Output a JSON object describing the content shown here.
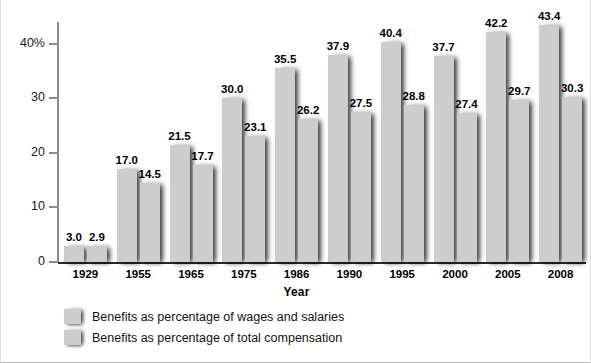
{
  "chart_data": {
    "type": "bar",
    "title": "",
    "xlabel": "Year",
    "ylabel": "Percentage",
    "categories": [
      "1929",
      "1955",
      "1965",
      "1975",
      "1986",
      "1990",
      "1995",
      "2000",
      "2005",
      "2008"
    ],
    "series": [
      {
        "name": "Benefits as percentage of wages and salaries",
        "values": [
          3.0,
          17.0,
          21.5,
          30.0,
          35.5,
          37.9,
          40.4,
          37.7,
          42.2,
          43.4
        ],
        "labels": [
          "3.0",
          "17.0",
          "21.5",
          "30.0",
          "35.5",
          "37.9",
          "40.4",
          "37.7",
          "42.2",
          "43.4"
        ],
        "color": "#cdcdcd"
      },
      {
        "name": "Benefits as percentage of total compensation",
        "values": [
          2.9,
          14.5,
          17.7,
          23.1,
          26.2,
          27.5,
          28.8,
          27.4,
          29.7,
          30.3
        ],
        "labels": [
          "2.9",
          "14.5",
          "17.7",
          "23.1",
          "26.2",
          "27.5",
          "28.8",
          "27.4",
          "29.7",
          "30.3"
        ],
        "color": "#cdcdcd"
      }
    ],
    "ylim": [
      0,
      44
    ],
    "yticks": [
      0,
      10,
      20,
      30,
      40
    ],
    "ytick_labels": [
      "0",
      "10",
      "20",
      "30",
      "40%"
    ],
    "grid": false,
    "legend_position": "bottom-left"
  },
  "legend": {
    "items": [
      {
        "label": "Benefits as percentage of wages and salaries"
      },
      {
        "label": "Benefits as percentage of total compensation"
      }
    ]
  }
}
